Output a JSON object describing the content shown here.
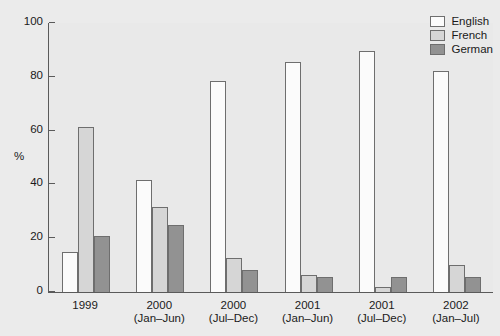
{
  "chart_data": {
    "type": "bar",
    "title": "",
    "xlabel": "",
    "ylabel": "%",
    "ylim": [
      0,
      100
    ],
    "yticks": [
      0,
      20,
      40,
      60,
      80,
      100
    ],
    "ytick_labels": [
      "0",
      "20",
      "40",
      "60",
      "80",
      "100"
    ],
    "grid": false,
    "legend_position": "top-right",
    "categories": [
      "1999",
      "2000 (Jan–Jun)",
      "2000 (Jul–Dec)",
      "2001 (Jan–Jun)",
      "2001 (Jul–Dec)",
      "2002 (Jan–Jul)"
    ],
    "category_lines": [
      {
        "year": "1999",
        "period": ""
      },
      {
        "year": "2000",
        "period": "(Jan–Jun)"
      },
      {
        "year": "2000",
        "period": "(Jul–Dec)"
      },
      {
        "year": "2001",
        "period": "(Jan–Jun)"
      },
      {
        "year": "2001",
        "period": "(Jul–Dec)"
      },
      {
        "year": "2002",
        "period": "(Jan–Jul)"
      }
    ],
    "series": [
      {
        "name": "English",
        "color": "#fbfbfb",
        "values": [
          15,
          41.5,
          78.5,
          85.5,
          89.5,
          82
        ]
      },
      {
        "name": "French",
        "color": "#d6d6d6",
        "values": [
          61.5,
          31.5,
          12.5,
          6.5,
          2,
          10
        ]
      },
      {
        "name": "German",
        "color": "#929292",
        "values": [
          21,
          25,
          8,
          5.5,
          5.5,
          5.5
        ]
      }
    ]
  },
  "legend": {
    "items": [
      {
        "label": "English"
      },
      {
        "label": "French"
      },
      {
        "label": "German"
      }
    ]
  }
}
